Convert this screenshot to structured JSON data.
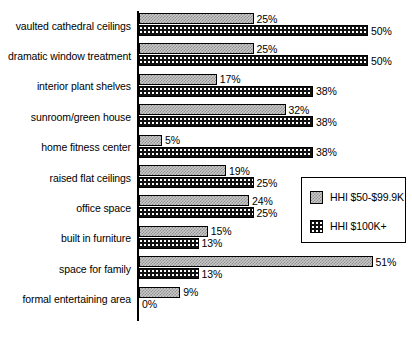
{
  "chart_data": {
    "type": "bar",
    "orientation": "horizontal",
    "title": "",
    "xlabel": "",
    "ylabel": "",
    "xlim": [
      0,
      55
    ],
    "grid": false,
    "legend_position": "center-right",
    "value_suffix": "%",
    "categories": [
      "vaulted cathedral ceilings",
      "dramatic window treatment",
      "interior plant shelves",
      "sunroom/green house",
      "home fitness center",
      "raised flat ceilings",
      "office space",
      "built in furniture",
      "space for family",
      "formal entertaining area"
    ],
    "series": [
      {
        "name": "HHI $50-$99.9K",
        "pattern": "light-checker",
        "values": [
          25,
          25,
          17,
          32,
          5,
          19,
          24,
          15,
          51,
          9
        ],
        "labels": [
          "25%",
          "25%",
          "17%",
          "32%",
          "5%",
          "19%",
          "24%",
          "15%",
          "51%",
          "9%"
        ]
      },
      {
        "name": "HHI $100K+",
        "pattern": "dark-dotted",
        "values": [
          50,
          50,
          38,
          38,
          38,
          25,
          25,
          13,
          13,
          0
        ],
        "labels": [
          "50%",
          "50%",
          "38%",
          "38%",
          "38%",
          "25%",
          "25%",
          "13%",
          "13%",
          "0%"
        ]
      }
    ]
  },
  "legend": {
    "items": [
      {
        "label": "HHI $50-$99.9K",
        "swatch": "light-checker-swatch"
      },
      {
        "label": "HHI $100K+",
        "swatch": "dark-dotted-swatch"
      }
    ]
  }
}
